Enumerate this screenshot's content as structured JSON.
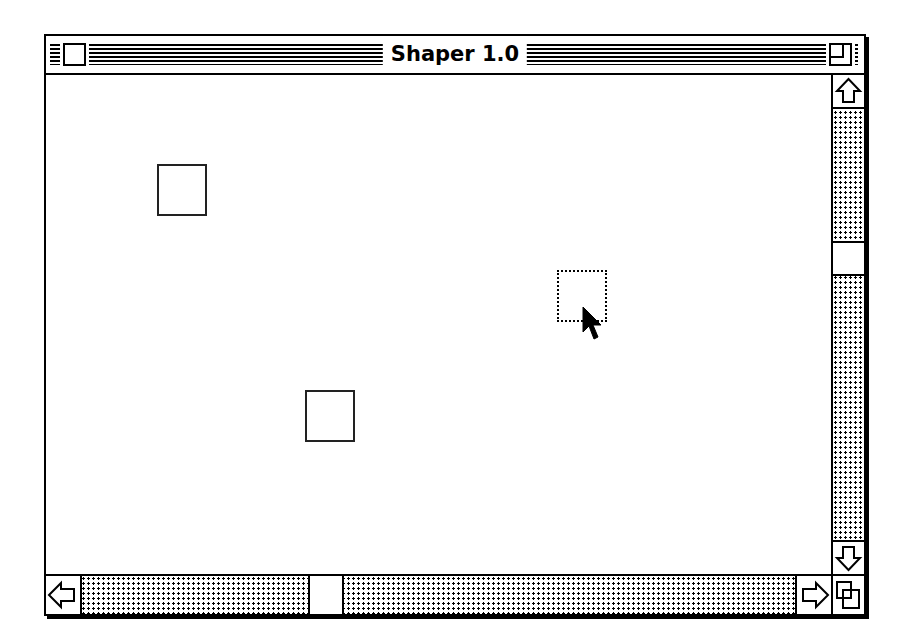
{
  "window": {
    "title": "Shaper 1.0",
    "close_box_icon": "close-box-icon",
    "zoom_box_icon": "zoom-box-icon"
  },
  "canvas": {
    "shapes": [
      {
        "type": "square",
        "x": 157,
        "y": 162,
        "w": 52,
        "h": 54,
        "selected": false
      },
      {
        "type": "square",
        "x": 557,
        "y": 268,
        "w": 54,
        "h": 55,
        "selected": true
      },
      {
        "type": "square",
        "x": 305,
        "y": 388,
        "w": 53,
        "h": 55,
        "selected": false
      }
    ],
    "cursor": {
      "icon": "arrow-pointer-icon",
      "x": 582,
      "y": 306
    }
  },
  "scrollbars": {
    "vertical": {
      "up_icon": "up-arrow-icon",
      "down_icon": "down-arrow-icon",
      "thumb_position": "middle"
    },
    "horizontal": {
      "left_icon": "left-arrow-icon",
      "right_icon": "right-arrow-icon",
      "thumb_position": "left-third"
    },
    "grow_box_icon": "size-box-icon"
  }
}
